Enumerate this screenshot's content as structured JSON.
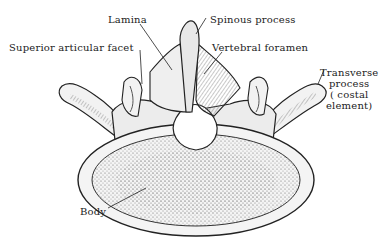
{
  "figure": {
    "labels": {
      "lamina": "Lamina",
      "spinous_process": "Spinous process",
      "superior_articular_facet": "Superior articular facet",
      "vertebral_foramen": "Vertebral foramen",
      "transverse_process": [
        "Transverse",
        "process",
        "( costal",
        "element)"
      ],
      "body": "Body"
    },
    "colors": {
      "ink": "#222222",
      "bone_fill": "#f2f2f2",
      "shade": "#8a8a8a",
      "background": "#ffffff"
    }
  }
}
